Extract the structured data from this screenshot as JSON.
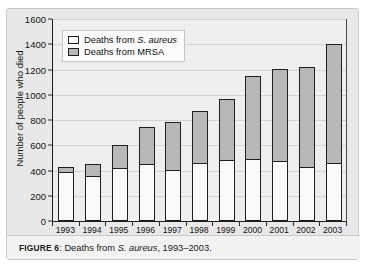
{
  "figure": {
    "caption_label": "FIGURE 6",
    "caption_separator": ":",
    "caption_text_before_italic": " Deaths from ",
    "caption_italic": "S. aureus",
    "caption_text_after_italic": ", 1993–2003."
  },
  "legend": {
    "position": "inside-top-left",
    "entries": [
      {
        "label_prefix": "Deaths from ",
        "label_italic": "S. aureus",
        "label_suffix": "",
        "color": "#fdfdfd",
        "name": "aureus"
      },
      {
        "label_prefix": "Deaths from MRSA",
        "label_italic": "",
        "label_suffix": "",
        "color": "#b8b8b8",
        "name": "mrsa"
      }
    ]
  },
  "chart_data": {
    "type": "bar",
    "stacked": true,
    "title": "",
    "subtitle": "",
    "xlabel": "Year",
    "ylabel": "Number of people who died",
    "categories": [
      "1993",
      "1994",
      "1995",
      "1996",
      "1997",
      "1998",
      "1999",
      "2000",
      "2001",
      "2002",
      "2003"
    ],
    "series": [
      {
        "name": "Deaths from S. aureus",
        "color": "#fafafa",
        "values": [
          380,
          350,
          410,
          440,
          395,
          455,
          475,
          480,
          470,
          420,
          450
        ]
      },
      {
        "name": "Deaths from MRSA",
        "color": "#b8b8b8",
        "values": [
          45,
          100,
          195,
          305,
          390,
          415,
          490,
          670,
          735,
          800,
          950
        ]
      }
    ],
    "totals": [
      425,
      450,
      605,
      745,
      785,
      870,
      965,
      1150,
      1205,
      1220,
      1400
    ],
    "ylim": [
      0,
      1600
    ],
    "yticks": [
      0,
      200,
      400,
      600,
      800,
      1000,
      1200,
      1400,
      1600
    ],
    "ytick_labels": [
      "0",
      "200",
      "400",
      "600",
      "800",
      "1000",
      "1200",
      "1400",
      "1600"
    ],
    "grid": true,
    "legend_position": "upper left"
  }
}
